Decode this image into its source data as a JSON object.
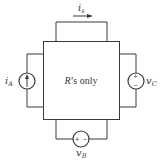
{
  "diagram": {
    "type": "circuit",
    "network_label": {
      "italic_part": "R",
      "rest": "’s only"
    },
    "top_branch": {
      "current_label": "i",
      "current_sub": "s",
      "arrow_direction": "right"
    },
    "left_source": {
      "kind": "current-source",
      "label": "i",
      "label_sub": "A",
      "arrow_direction": "up"
    },
    "right_source": {
      "kind": "voltage-source",
      "label": "v",
      "label_sub": "C",
      "plus": "+",
      "minus": "−",
      "polarity": "plus-top"
    },
    "bottom_source": {
      "kind": "voltage-source",
      "label": "v",
      "label_sub": "B",
      "plus": "+",
      "minus": "−",
      "polarity": "plus-left"
    },
    "colors": {
      "line": "#3a3a3a",
      "background": "#ffffff"
    }
  }
}
